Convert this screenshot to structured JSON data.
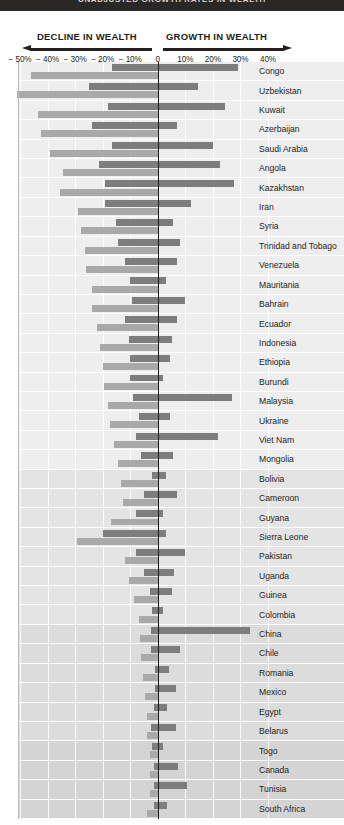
{
  "topbar": {
    "title": "UNADJUSTED GROWTH RATES IN WEALTH"
  },
  "header": {
    "decline_label": "DECLINE IN WEALTH",
    "growth_label": "GROWTH IN WEALTH",
    "left_arrow_icon": "arrow-left-icon",
    "right_arrow_icon": "arrow-right-icon"
  },
  "chart_data": {
    "type": "bar",
    "orientation": "horizontal",
    "title": "UNADJUSTED GROWTH RATES IN WEALTH",
    "xlabel": "",
    "ylabel": "",
    "xlim": [
      -50,
      40
    ],
    "grid": true,
    "legend_position": "none",
    "tick_labels": [
      "− 50%",
      "− 40%",
      "− 30%",
      "− 20%",
      "− 10%",
      "0",
      "10%",
      "20%",
      "30%",
      "40%"
    ],
    "tick_values": [
      -50,
      -40,
      -30,
      -20,
      -10,
      0,
      10,
      20,
      30,
      40
    ],
    "categories": [
      "Congo",
      "Uzbekistan",
      "Kuwait",
      "Azerbaijan",
      "Saudi Arabia",
      "Angola",
      "Kazakhstan",
      "Iran",
      "Syria",
      "Trinidad and Tobago",
      "Venezuela",
      "Mauritania",
      "Bahrain",
      "Ecuador",
      "Indonesia",
      "Ethiopia",
      "Burundi",
      "Malaysia",
      "Ukraine",
      "Viet Nam",
      "Mongolia",
      "Bolivia",
      "Cameroon",
      "Guyana",
      "Sierra Leone",
      "Pakistan",
      "Uganda",
      "Guinea",
      "Colombia",
      "China",
      "Chile",
      "Romania",
      "Mexico",
      "Egypt",
      "Belarus",
      "Togo",
      "Canada",
      "Tunisia",
      "South Africa"
    ],
    "series": [
      {
        "name": "Unadjusted growth rate",
        "color": "#7d7d7d",
        "start": [
          -16.5,
          -25.0,
          -18.0,
          -24.0,
          -16.5,
          -21.5,
          -19.0,
          -19.0,
          -15.0,
          -14.5,
          -12.0,
          -10.0,
          -9.5,
          -12.0,
          -10.5,
          -10.0,
          -10.0,
          -9.0,
          -7.0,
          -8.0,
          -6.0,
          -2.0,
          -5.0,
          -8.0,
          -20.0,
          -8.0,
          -5.0,
          -3.0,
          -2.0,
          -2.5,
          -2.5,
          -1.0,
          -1.0,
          -1.5,
          -2.5,
          -2.0,
          -1.5,
          -1.5,
          -1.5
        ],
        "end": [
          29.0,
          14.5,
          24.5,
          7.0,
          20.0,
          22.5,
          27.5,
          12.0,
          5.5,
          8.0,
          7.0,
          3.0,
          10.0,
          7.0,
          5.0,
          4.5,
          2.0,
          27.0,
          4.5,
          22.0,
          5.5,
          3.0,
          7.0,
          2.0,
          3.0,
          10.0,
          6.0,
          5.0,
          2.0,
          33.5,
          8.0,
          4.0,
          6.5,
          3.5,
          6.5,
          2.0,
          7.5,
          10.5,
          3.5
        ]
      },
      {
        "name": "Adjusted growth rate",
        "color": "#a9a9a9",
        "start": [
          -46.0,
          -51.0,
          -43.5,
          -42.5,
          -39.0,
          -34.5,
          -35.5,
          -29.0,
          -28.0,
          -26.5,
          -26.0,
          -24.0,
          -24.0,
          -22.0,
          -21.0,
          -20.0,
          -19.5,
          -18.0,
          -17.5,
          -16.0,
          -14.5,
          -13.5,
          -12.5,
          -17.0,
          -29.5,
          -12.0,
          -10.5,
          -8.5,
          -7.0,
          -6.5,
          -6.0,
          -5.5,
          -4.5,
          -4.0,
          -4.0,
          -3.0,
          -3.0,
          -3.0,
          -4.0
        ],
        "end": [
          0,
          0,
          0,
          0,
          0,
          0,
          0,
          0,
          0,
          0,
          0,
          0,
          0,
          0,
          0,
          0,
          0,
          0,
          0,
          0,
          0,
          0,
          0,
          0,
          0,
          0,
          0,
          0,
          0,
          0,
          0,
          0,
          0,
          0,
          0,
          0,
          0,
          0,
          0
        ]
      }
    ]
  }
}
